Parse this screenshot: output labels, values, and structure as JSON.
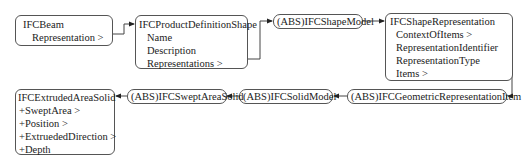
{
  "diagram": {
    "nodes": {
      "beam": {
        "title": "IFCBeam",
        "attributes": [
          "Representation >"
        ]
      },
      "pds": {
        "title": "IFCProductDefinitionShape",
        "attributes": [
          "Name",
          "Description",
          "Representations >"
        ]
      },
      "shape_model": {
        "title": "(ABS)IFCShapeModel"
      },
      "shape_rep": {
        "title": "IFCShapeRepresentation",
        "attributes": [
          "ContextOfItems >",
          "RepresentationIdentifier",
          "RepresentationType",
          "Items >"
        ]
      },
      "geo_item": {
        "title": "(ABS)IFCGeometricRepresentationItem"
      },
      "solid_model": {
        "title": "(ABS)IFCSolidModel"
      },
      "swept": {
        "title": "(ABS)IFCSweptAreaSolid"
      },
      "extruded": {
        "title": "IFCExtrudedAreaSolid",
        "attributes": [
          "+SweptArea >",
          "+Position >",
          "+ExtruededDirection >",
          "+Depth"
        ]
      }
    },
    "edges": [
      {
        "from": "IFCBeam",
        "to": "IFCProductDefinitionShape"
      },
      {
        "from": "IFCProductDefinitionShape",
        "to": "(ABS)IFCShapeModel"
      },
      {
        "from": "(ABS)IFCShapeModel",
        "to": "IFCShapeRepresentation"
      },
      {
        "from": "IFCShapeRepresentation",
        "to": "(ABS)IFCGeometricRepresentationItem"
      },
      {
        "from": "(ABS)IFCGeometricRepresentationItem",
        "to": "(ABS)IFCSolidModel"
      },
      {
        "from": "(ABS)IFCSolidModel",
        "to": "(ABS)IFCSweptAreaSolid"
      },
      {
        "from": "(ABS)IFCSweptAreaSolid",
        "to": "IFCExtrudedAreaSolid"
      }
    ]
  }
}
